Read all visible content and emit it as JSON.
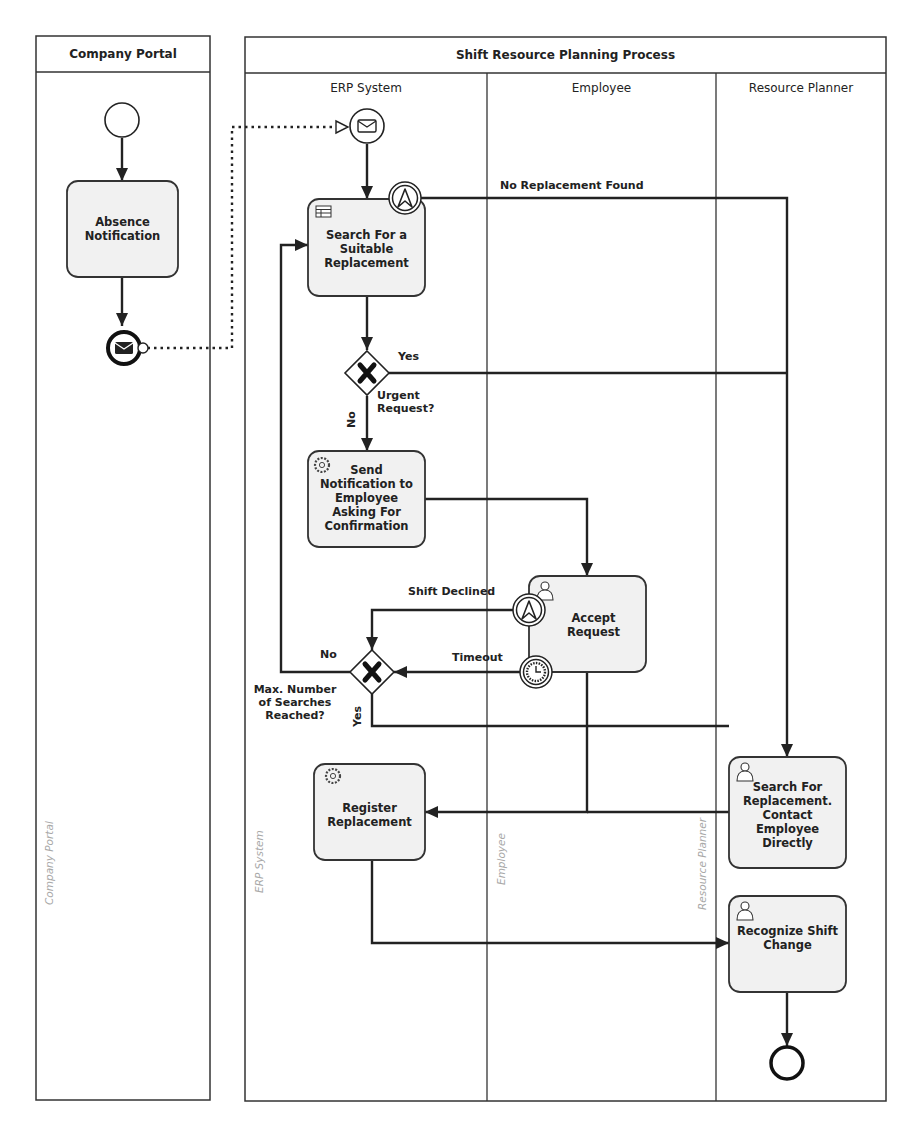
{
  "pools": {
    "company_portal": {
      "title": "Company Portal",
      "side_label": "Company Portal"
    },
    "main": {
      "title": "Shift Resource Planning Process"
    }
  },
  "lanes": [
    {
      "title": "ERP System",
      "side_label": "ERP System"
    },
    {
      "title": "Employee",
      "side_label": "Employee"
    },
    {
      "title": "Resource Planner",
      "side_label": "Resource Planner"
    }
  ],
  "tasks": {
    "absence_notification": {
      "label": "Absence Notification",
      "type": "task",
      "icon": "none"
    },
    "search_replacement": {
      "label": "Search For a Suitable Replacement",
      "type": "business-rule-task",
      "icon": "table-icon"
    },
    "send_notification": {
      "label": "Send Notification to Employee Asking For Confirmation",
      "type": "service-task",
      "icon": "gear-icon"
    },
    "accept_request": {
      "label": "Accept Request",
      "type": "user-task",
      "icon": "user-icon"
    },
    "register_replacement": {
      "label": "Register Replacement",
      "type": "service-task",
      "icon": "gear-icon"
    },
    "search_contact_directly": {
      "label": "Search For Replacement. Contact Employee Directly",
      "type": "user-task",
      "icon": "user-icon"
    },
    "recognize_shift_change": {
      "label": "Recognize Shift Change",
      "type": "user-task",
      "icon": "user-icon"
    }
  },
  "gateways": {
    "urgent_request": {
      "label": "Urgent Request?",
      "yes": "Yes",
      "no": "No"
    },
    "max_searches": {
      "label": "Max. Number of Searches Reached?",
      "yes": "Yes",
      "no": "No"
    }
  },
  "edge_labels": {
    "no_replacement_found": "No Replacement Found",
    "shift_declined": "Shift Declined",
    "timeout": "Timeout"
  },
  "events": {
    "start": "start-event",
    "message_end": "message-end-event",
    "message_start": "message-start-event",
    "escalation_boundary_1": "escalation-boundary-event",
    "escalation_boundary_2": "escalation-boundary-event",
    "timer_boundary": "timer-boundary-event",
    "end": "end-event"
  }
}
